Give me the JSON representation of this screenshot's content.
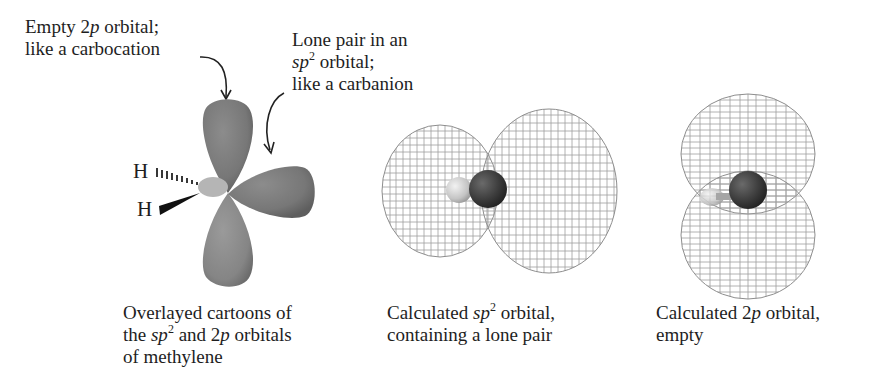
{
  "figure": {
    "callouts": {
      "empty_2p": {
        "line1_pre": "Empty 2",
        "line1_ital": "p",
        "line1_post": " orbital;",
        "line2": "like a carbocation"
      },
      "lone_pair": {
        "line1": "Lone pair in an",
        "line2_ital": "sp",
        "line2_sup": "2",
        "line2_post": " orbital;",
        "line3": "like a carbanion"
      }
    },
    "atom_labels": {
      "h_top": "H",
      "h_bottom": "H"
    },
    "panels": [
      {
        "name": "cartoon",
        "caption": {
          "line1": "Overlayed cartoons of",
          "line2_pre": "the ",
          "line2_ital1": "sp",
          "line2_sup": "2",
          "line2_mid": " and 2",
          "line2_ital2": "p",
          "line2_post": " orbitals",
          "line3": "of methylene"
        }
      },
      {
        "name": "calculated-sp2",
        "caption": {
          "line1_pre": "Calculated ",
          "line1_ital": "sp",
          "line1_sup": "2",
          "line1_post": " orbital,",
          "line2": "containing a lone pair"
        }
      },
      {
        "name": "calculated-2p",
        "caption": {
          "line1_pre": "Calculated 2",
          "line1_ital": "p",
          "line1_post": " orbital,",
          "line2": "empty"
        }
      }
    ],
    "colors": {
      "lobe": "#7a7a7a",
      "lobe_dark": "#5a5a5a",
      "mesh": "#9a9a9a",
      "carbon": "#3a3a3a",
      "hydrogen": "#c8c8c8",
      "text": "#1e1e1e"
    }
  }
}
